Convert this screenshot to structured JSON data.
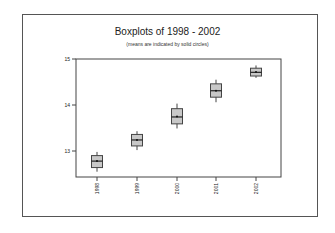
{
  "chart_data": {
    "type": "boxplot",
    "title": "Boxplots of 1998 - 2002",
    "subtitle": "(means are indicated by solid circles)",
    "xlabel": "",
    "ylabel": "",
    "categories": [
      "1998",
      "1999",
      "2000",
      "2001",
      "2002"
    ],
    "yticks": [
      13,
      14,
      15
    ],
    "ylim": [
      12.4,
      15.0
    ],
    "grid": false,
    "legend": null,
    "boxes": [
      {
        "label": "1998",
        "whisker_low": 12.55,
        "q1": 12.64,
        "median": 12.78,
        "q3": 12.9,
        "whisker_high": 12.98,
        "mean": 12.78
      },
      {
        "label": "1999",
        "whisker_low": 13.02,
        "q1": 13.11,
        "median": 13.24,
        "q3": 13.36,
        "whisker_high": 13.43,
        "mean": 13.24
      },
      {
        "label": "2000",
        "whisker_low": 13.49,
        "q1": 13.59,
        "median": 13.74,
        "q3": 13.92,
        "whisker_high": 14.03,
        "mean": 13.75
      },
      {
        "label": "2001",
        "whisker_low": 14.06,
        "q1": 14.17,
        "median": 14.31,
        "q3": 14.46,
        "whisker_high": 14.55,
        "mean": 14.31
      },
      {
        "label": "2002",
        "whisker_low": 14.59,
        "q1": 14.63,
        "median": 14.71,
        "q3": 14.8,
        "whisker_high": 14.86,
        "mean": 14.72
      }
    ]
  },
  "style": {
    "box_fill": "#c8c8c8",
    "box_stroke": "#444444",
    "axis_color": "#444444"
  }
}
